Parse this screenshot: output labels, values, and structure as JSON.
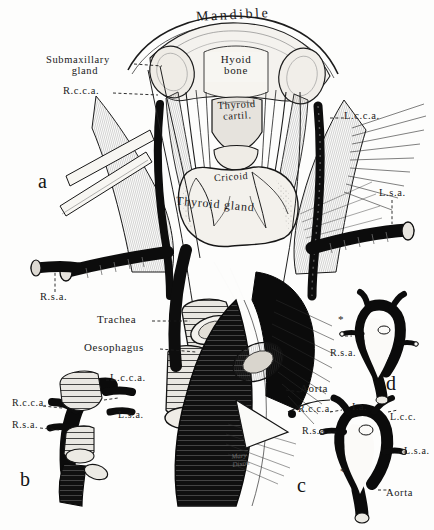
{
  "plate": {
    "title": "Mandible",
    "signature_line1": "Mary",
    "signature_line2": "Dixon"
  },
  "panels": [
    {
      "id": "a",
      "letter": "a"
    },
    {
      "id": "b",
      "letter": "b"
    },
    {
      "id": "c",
      "letter": "c"
    },
    {
      "id": "d",
      "letter": "d"
    }
  ],
  "labels": {
    "mandible": "Mandible",
    "submaxillary_gland_l1": "Submaxillary",
    "submaxillary_gland_l2": "gland",
    "rcca_top": "R.c.c.a.",
    "hyoid_l1": "Hyoid",
    "hyoid_l2": "bone",
    "thyroid_cartilage_l1": "Thyroid",
    "thyroid_cartilage_l2": "cartil.",
    "lcca_right": "L.c.c.a.",
    "cricoid": "Cricoid",
    "thyroid_gland": "Thyroid gland",
    "lsa_right": "L.s.a.",
    "rsa_left": "R.s.a.",
    "trachea": "Trachea",
    "oesophagus": "Oesophagus",
    "lcca_lower": "L.c.c.a.",
    "aorta_main": "Aorta"
  },
  "panel_b": {
    "lcca": "L.c.c.a.",
    "rcca": "R.c.c.a.",
    "rsa": "R.s.a.",
    "lsa": "L.s.a."
  },
  "panel_c": {
    "rcca": "R.c.c.a.",
    "ia": "I.a.",
    "lcc": "L.c.c.",
    "rsa": "R.s.a.",
    "lsa": "L.s.a.",
    "aorta": "Aorta",
    "asterisk": "*"
  },
  "panel_d": {
    "rsa": "R.s.a.",
    "asterisk": "*"
  },
  "colors": {
    "ink": "#141414",
    "paper": "#fdfdfc",
    "vessel_dark": "#0c0c0c",
    "tissue_mid": "#8a8a86"
  }
}
